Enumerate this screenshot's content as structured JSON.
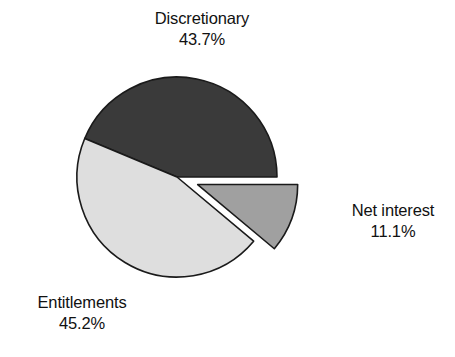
{
  "chart_data": {
    "type": "pie",
    "title": "",
    "subtitle": "",
    "xlabel": "",
    "ylabel": "",
    "legend_position": "none",
    "grid": false,
    "units": "percent",
    "categories": [
      "Discretionary",
      "Entitlements",
      "Net interest"
    ],
    "values": [
      43.7,
      45.2,
      11.1
    ],
    "labels": [
      "43.7%",
      "45.2%",
      "11.1%"
    ],
    "colors": [
      "#3a3a3a",
      "#dedede",
      "#a0a0a0"
    ],
    "slices": [
      {
        "name": "Discretionary",
        "value": 43.7,
        "value_label": "43.7%",
        "color": "#3a3a3a",
        "exploded": false,
        "label_position": "top"
      },
      {
        "name": "Entitlements",
        "value": 45.2,
        "value_label": "45.2%",
        "color": "#dedede",
        "exploded": true,
        "label_position": "bottom-left"
      },
      {
        "name": "Net interest",
        "value": 11.1,
        "value_label": "11.1%",
        "color": "#a0a0a0",
        "exploded": true,
        "label_position": "right"
      }
    ],
    "geometry": {
      "center_x": 177,
      "center_y": 177,
      "radius": 100,
      "start_angle_deg": 0,
      "direction": "counterclockwise",
      "explode_offset": 22,
      "stroke": "#1a1a1a",
      "stroke_width": 1.6,
      "background": "#ffffff"
    }
  },
  "labels": {
    "discretionary": {
      "name": "Discretionary",
      "value": "43.7%"
    },
    "net_interest": {
      "name": "Net interest",
      "value": "11.1%"
    },
    "entitlements": {
      "name": "Entitlements",
      "value": "45.2%"
    }
  }
}
